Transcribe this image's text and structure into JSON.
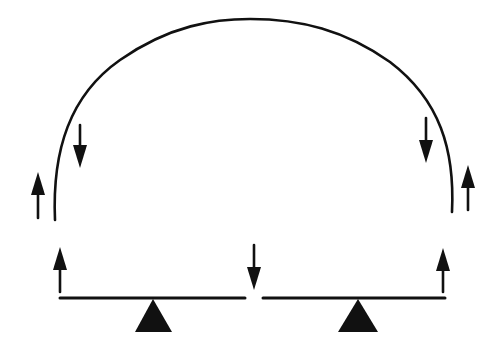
{
  "diagram": {
    "title": "",
    "colors": {
      "ink": "#111111",
      "background": "#ffffff"
    },
    "arch": {
      "start": [
        55,
        220
      ],
      "peak": [
        250,
        19
      ],
      "end": [
        452,
        212
      ]
    },
    "levers": [
      {
        "name": "left-lever",
        "beam": [
          60,
          298,
          245,
          298
        ],
        "fulcrum": [
          [
            153,
            299
          ],
          [
            135,
            332
          ],
          [
            172,
            332
          ]
        ]
      },
      {
        "name": "right-lever",
        "beam": [
          263,
          298,
          445,
          298
        ],
        "fulcrum": [
          [
            358,
            299
          ],
          [
            338,
            332
          ],
          [
            378,
            332
          ]
        ]
      }
    ],
    "arrows": [
      {
        "name": "arch-left-inner-down",
        "direction": "down",
        "x": 80,
        "tail": 125,
        "tip": 168
      },
      {
        "name": "arch-right-inner-down",
        "direction": "down",
        "x": 426,
        "tail": 118,
        "tip": 163
      },
      {
        "name": "arch-left-outer-up",
        "direction": "up",
        "x": 38,
        "tail": 218,
        "tip": 172
      },
      {
        "name": "arch-right-outer-up",
        "direction": "up",
        "x": 468,
        "tail": 210,
        "tip": 165
      },
      {
        "name": "left-lever-end-up",
        "direction": "up",
        "x": 60,
        "tail": 292,
        "tip": 247
      },
      {
        "name": "right-lever-end-up",
        "direction": "up",
        "x": 443,
        "tail": 292,
        "tip": 248
      },
      {
        "name": "center-gap-down",
        "direction": "down",
        "x": 254,
        "tail": 245,
        "tip": 290
      }
    ]
  }
}
